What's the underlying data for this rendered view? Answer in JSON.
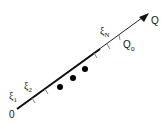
{
  "diagram": {
    "axis_label": "Q",
    "origin_label": "0",
    "points_labels": [
      {
        "symbol": "ξ",
        "subscript": "1"
      },
      {
        "symbol": "ξ",
        "subscript": "2"
      },
      {
        "symbol": "ξ",
        "subscript": "N"
      }
    ],
    "marker_label": {
      "symbol": "Q",
      "subscript": "o"
    },
    "dots_count": 3,
    "colors": {
      "line": "#111111",
      "tick": "#888888",
      "dot": "#000000"
    }
  }
}
